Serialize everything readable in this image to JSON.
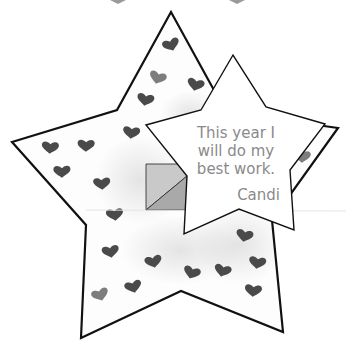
{
  "note": {
    "lines": [
      "This year I",
      "will do my",
      "best work."
    ],
    "signature": "Candi"
  },
  "colors": {
    "background": "#ffffff",
    "outline": "#111111",
    "heart_dark": "#4a4a4a",
    "heart_light": "#7d7d7d",
    "text": "#8a8a8a",
    "square_light": "#c9c9c9",
    "square_dark": "#a9a9a9"
  },
  "big_star": {
    "points": "171,12 117,110 12,142 86,225 81,338 181,291 283,332 272,220 338,128 226,112"
  },
  "small_star": {
    "points": "233,55 201,110 146,125 187,176 184,234 239,209 294,230 290,170 325,124 266,107"
  },
  "hearts": [
    {
      "x": 172,
      "y": 45,
      "tone": "dark"
    },
    {
      "x": 157,
      "y": 78,
      "tone": "light"
    },
    {
      "x": 195,
      "y": 85,
      "tone": "dark"
    },
    {
      "x": 145,
      "y": 100,
      "tone": "dark"
    },
    {
      "x": 131,
      "y": 133,
      "tone": "dark"
    },
    {
      "x": 50,
      "y": 148,
      "tone": "dark"
    },
    {
      "x": 86,
      "y": 146,
      "tone": "dark"
    },
    {
      "x": 62,
      "y": 172,
      "tone": "dark"
    },
    {
      "x": 102,
      "y": 184,
      "tone": "dark"
    },
    {
      "x": 115,
      "y": 215,
      "tone": "dark"
    },
    {
      "x": 111,
      "y": 252,
      "tone": "dark"
    },
    {
      "x": 154,
      "y": 262,
      "tone": "dark"
    },
    {
      "x": 134,
      "y": 287,
      "tone": "dark"
    },
    {
      "x": 101,
      "y": 295,
      "tone": "light"
    },
    {
      "x": 191,
      "y": 273,
      "tone": "dark"
    },
    {
      "x": 222,
      "y": 271,
      "tone": "dark"
    },
    {
      "x": 244,
      "y": 236,
      "tone": "dark"
    },
    {
      "x": 257,
      "y": 263,
      "tone": "dark"
    },
    {
      "x": 253,
      "y": 291,
      "tone": "dark"
    },
    {
      "x": 302,
      "y": 157,
      "tone": "light"
    }
  ]
}
